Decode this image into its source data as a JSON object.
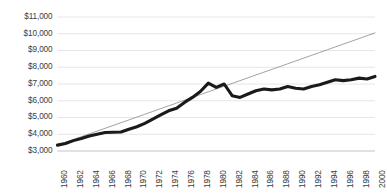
{
  "chart_data": {
    "type": "line",
    "title": "",
    "subtitle": "",
    "xlabel": "",
    "ylabel": "",
    "grid": "horizontal",
    "legend_position": "none",
    "xlim": [
      1960,
      2000
    ],
    "ylim": [
      3000,
      11000
    ],
    "ytick_step": 1000,
    "ytick_labels": [
      "$11,000",
      "$10,000",
      "$9,000",
      "$8,000",
      "$7,000",
      "$6,000",
      "$5,000",
      "$4,000",
      "$3,000"
    ],
    "ytick_values": [
      11000,
      10000,
      9000,
      8000,
      7000,
      6000,
      5000,
      4000,
      3000
    ],
    "xtick_labels": [
      "1960",
      "1962",
      "1964",
      "1966",
      "1968",
      "1970",
      "1972",
      "1974",
      "1976",
      "1978",
      "1980",
      "1982",
      "1984",
      "1986",
      "1988",
      "1990",
      "1992",
      "1994",
      "1996",
      "1998",
      "2000"
    ],
    "xtick_values": [
      1960,
      1962,
      1964,
      1966,
      1968,
      1970,
      1972,
      1974,
      1976,
      1978,
      1980,
      1982,
      1984,
      1986,
      1988,
      1990,
      1992,
      1994,
      1996,
      1998,
      2000
    ],
    "x": [
      1960,
      1961,
      1962,
      1963,
      1964,
      1965,
      1966,
      1967,
      1968,
      1969,
      1970,
      1971,
      1972,
      1973,
      1974,
      1975,
      1976,
      1977,
      1978,
      1979,
      1980,
      1981,
      1982,
      1983,
      1984,
      1985,
      1986,
      1987,
      1988,
      1989,
      1990,
      1991,
      1992,
      1993,
      1994,
      1995,
      1996,
      1997,
      1998,
      1999,
      2000
    ],
    "series": [
      {
        "name": "Actual",
        "style": "thick-solid",
        "color": "#1a1a1a",
        "line_width": 3.1,
        "values": [
          3350,
          3450,
          3620,
          3750,
          3900,
          4000,
          4100,
          4120,
          4130,
          4300,
          4450,
          4650,
          4900,
          5150,
          5400,
          5550,
          5900,
          6200,
          6550,
          7050,
          6800,
          7000,
          6300,
          6200,
          6400,
          6600,
          6700,
          6650,
          6700,
          6850,
          6750,
          6700,
          6850,
          6950,
          7100,
          7250,
          7200,
          7250,
          7350,
          7300,
          7450
        ]
      },
      {
        "name": "Trend",
        "style": "thin-solid",
        "color": "#8a8a8a",
        "line_width": 0.8,
        "values": [
          3350,
          3518,
          3685,
          3853,
          4020,
          4188,
          4355,
          4523,
          4690,
          4858,
          5025,
          5193,
          5360,
          5528,
          5695,
          5863,
          6030,
          6198,
          6365,
          6533,
          6700,
          6868,
          7035,
          7203,
          7370,
          7538,
          7705,
          7873,
          8040,
          8208,
          8375,
          8543,
          8710,
          8878,
          9045,
          9213,
          9380,
          9548,
          9715,
          9883,
          10050
        ]
      }
    ]
  },
  "colors": {
    "background": "#ffffff",
    "gridline": "#e6e6e6",
    "axis": "#d0d0d0",
    "tick_text": "#3b3b3b",
    "actual_line": "#1a1a1a",
    "trend_line": "#8a8a8a"
  }
}
